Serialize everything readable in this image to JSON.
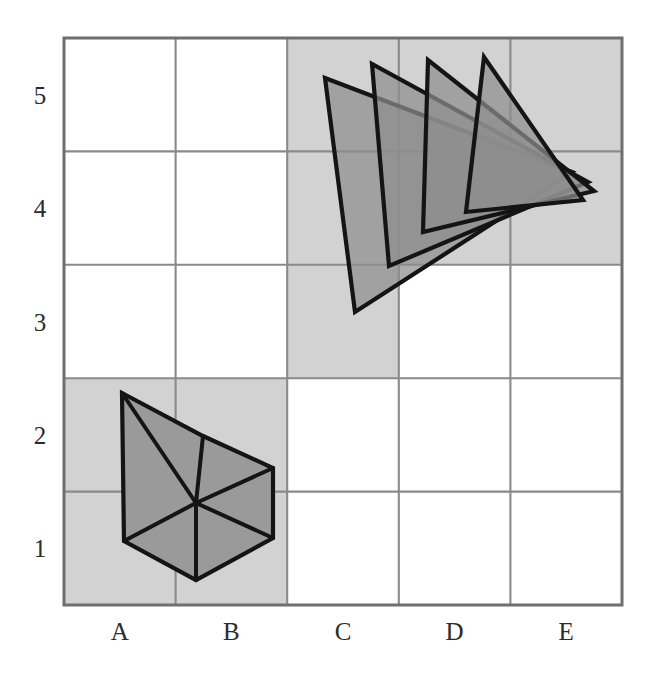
{
  "figure": {
    "background_color": "#ffffff"
  },
  "grid": {
    "columns": 5,
    "rows": 5,
    "left_px": 64,
    "top_px": 38,
    "right_px": 622,
    "bottom_px": 605,
    "cell_width_px": 111.6,
    "cell_height_px": 113.4,
    "line_color": "#8a8a8a",
    "border_color": "#6f6f6f",
    "shaded_cell_color": "#d2d2d2",
    "x_labels": [
      "A",
      "B",
      "C",
      "D",
      "E"
    ],
    "y_labels": [
      "1",
      "2",
      "3",
      "4",
      "5"
    ],
    "y_labels_bottom_to_top": true,
    "shaded_cells": [
      "A1",
      "A2",
      "B1",
      "B2",
      "C3",
      "C4",
      "C5",
      "D4",
      "D5",
      "E4",
      "E5"
    ]
  },
  "shapes": {
    "hexagon": {
      "name": "hexagon-six-triangles",
      "fill_color": "#9a9a9a",
      "stroke_color": "#141414",
      "center_px": [
        196,
        503
      ],
      "vertices_px": [
        [
          122,
          393
        ],
        [
          203,
          436
        ],
        [
          273,
          468
        ],
        [
          273,
          538
        ],
        [
          196,
          580
        ],
        [
          124,
          541
        ]
      ],
      "spoke_count": 6,
      "triangle_count": 6
    },
    "triangle_fan": {
      "name": "rotating-triangle-fan",
      "fill_color": "#8e8e8e",
      "fill_opacity": 0.72,
      "stroke_color": "#141414",
      "count": 4,
      "triangles": [
        {
          "id": 1,
          "vertices_px": [
            [
              325,
              78
            ],
            [
              355,
              312
            ],
            [
              572,
              172
            ]
          ]
        },
        {
          "id": 2,
          "vertices_px": [
            [
              372,
              64
            ],
            [
              389,
              266
            ],
            [
              588,
              182
            ]
          ]
        },
        {
          "id": 3,
          "vertices_px": [
            [
              428,
              60
            ],
            [
              423,
              232
            ],
            [
              594,
              191
            ]
          ]
        },
        {
          "id": 4,
          "vertices_px": [
            [
              484,
              57
            ],
            [
              466,
              212
            ],
            [
              583,
              200
            ]
          ]
        }
      ]
    }
  },
  "colors": {
    "shade": "#d2d2d2",
    "shape_fill": "#8e8e8e",
    "hexagon_fill": "#9a9a9a",
    "stroke": "#141414",
    "grid": "#8a8a8a",
    "label": "#2b2b2b"
  }
}
